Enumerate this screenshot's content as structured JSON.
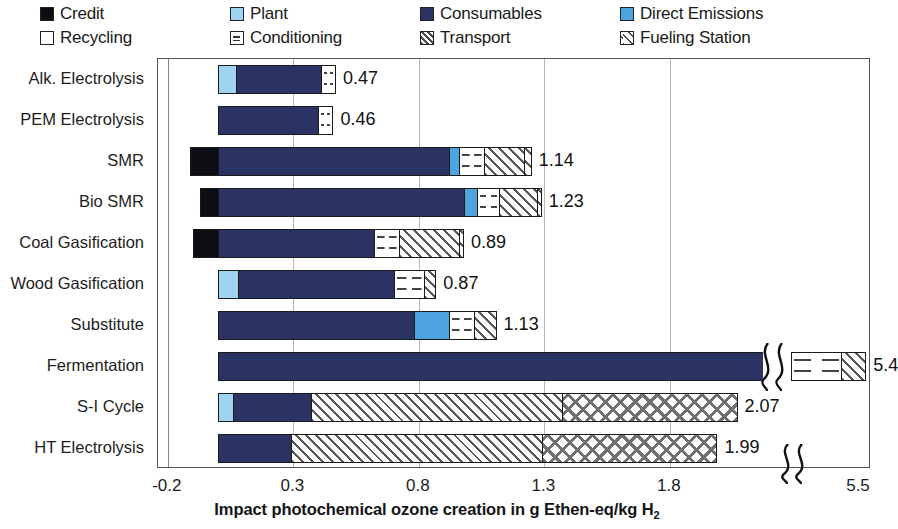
{
  "legend": {
    "items": [
      {
        "label": "Credit",
        "key": "credit",
        "color": "#0d0d14"
      },
      {
        "label": "Plant",
        "key": "plant",
        "color": "#9fd3f2"
      },
      {
        "label": "Consumables",
        "key": "consumables",
        "color": "#2b3264"
      },
      {
        "label": "Direct Emissions",
        "key": "direct",
        "color": "#4da2e0"
      },
      {
        "label": "Recycling",
        "key": "recycling",
        "color": "#ffffff"
      },
      {
        "label": "Conditioning",
        "key": "conditioning",
        "color": "#ffffff"
      },
      {
        "label": "Transport",
        "key": "transport",
        "color": "#ffffff"
      },
      {
        "label": "Fueling Station",
        "key": "fueling",
        "color": "#ffffff"
      }
    ]
  },
  "axis": {
    "x_ticks": [
      "-0.2",
      "0.3",
      "0.8",
      "1.3",
      "1.8",
      "5.5"
    ],
    "x_title_main": "Impact photochemical ozone creation in g Ethen-eq/kg H",
    "x_title_sub": "2"
  },
  "chart_data": {
    "type": "bar",
    "orientation": "horizontal",
    "stacked": true,
    "title": "",
    "xlabel": "Impact photochemical ozone creation in g Ethen-eq/kg H2",
    "ylabel": "",
    "xlim": [
      -0.2,
      5.5
    ],
    "xticks": [
      -0.2,
      0.3,
      0.8,
      1.3,
      1.8,
      5.5
    ],
    "axis_break": true,
    "axis_break_after": 2.15,
    "grid": true,
    "legend_position": "top",
    "series_names": [
      "Credit",
      "Plant",
      "Consumables",
      "Direct Emissions",
      "Recycling",
      "Conditioning",
      "Transport",
      "Fueling Station"
    ],
    "categories": [
      "Alk. Electrolysis",
      "PEM Electrolysis",
      "SMR",
      "Bio SMR",
      "Coal Gasification",
      "Wood Gasification",
      "Substitute",
      "Fermentation",
      "S-I Cycle",
      "HT Electrolysis"
    ],
    "totals": [
      0.47,
      0.46,
      1.14,
      1.23,
      0.89,
      0.87,
      1.13,
      5.4,
      2.07,
      1.99
    ],
    "total_labels": [
      "0.47",
      "0.46",
      "1.14",
      "1.23",
      "0.89",
      "0.87",
      "1.13",
      "5.4",
      "2.07",
      "1.99"
    ],
    "rows": [
      {
        "category": "Alk. Electrolysis",
        "total_label": "0.47",
        "segments": [
          {
            "key": "plant",
            "name": "Plant",
            "value": 0.07
          },
          {
            "key": "consumables",
            "name": "Consumables",
            "value": 0.34
          },
          {
            "key": "conditioning",
            "name": "Conditioning",
            "value": 0.06
          }
        ]
      },
      {
        "category": "PEM Electrolysis",
        "total_label": "0.46",
        "segments": [
          {
            "key": "consumables",
            "name": "Consumables",
            "value": 0.4
          },
          {
            "key": "conditioning",
            "name": "Conditioning",
            "value": 0.06
          }
        ]
      },
      {
        "category": "SMR",
        "total_label": "1.14",
        "segments": [
          {
            "key": "credit",
            "name": "Credit",
            "value": -0.11
          },
          {
            "key": "consumables",
            "name": "Consumables",
            "value": 0.92
          },
          {
            "key": "direct",
            "name": "Direct Emissions",
            "value": 0.04
          },
          {
            "key": "conditioning",
            "name": "Conditioning",
            "value": 0.1
          },
          {
            "key": "transport",
            "name": "Transport",
            "value": 0.16
          },
          {
            "key": "fueling",
            "name": "Fueling Station",
            "value": 0.03
          }
        ]
      },
      {
        "category": "Bio SMR",
        "total_label": "1.23",
        "segments": [
          {
            "key": "credit",
            "name": "Credit",
            "value": -0.07
          },
          {
            "key": "consumables",
            "name": "Consumables",
            "value": 0.98
          },
          {
            "key": "direct",
            "name": "Direct Emissions",
            "value": 0.05
          },
          {
            "key": "conditioning",
            "name": "Conditioning",
            "value": 0.09
          },
          {
            "key": "transport",
            "name": "Transport",
            "value": 0.15
          },
          {
            "key": "fueling",
            "name": "Fueling Station",
            "value": 0.02
          }
        ]
      },
      {
        "category": "Coal Gasification",
        "total_label": "0.89",
        "segments": [
          {
            "key": "credit",
            "name": "Credit",
            "value": -0.1
          },
          {
            "key": "consumables",
            "name": "Consumables",
            "value": 0.62
          },
          {
            "key": "conditioning",
            "name": "Conditioning",
            "value": 0.1
          },
          {
            "key": "transport",
            "name": "Transport",
            "value": 0.24
          },
          {
            "key": "fueling",
            "name": "Fueling Station",
            "value": 0.02
          }
        ]
      },
      {
        "category": "Wood Gasification",
        "total_label": "0.87",
        "segments": [
          {
            "key": "plant",
            "name": "Plant",
            "value": 0.08
          },
          {
            "key": "consumables",
            "name": "Consumables",
            "value": 0.62
          },
          {
            "key": "conditioning",
            "name": "Conditioning",
            "value": 0.12
          },
          {
            "key": "transport",
            "name": "Transport",
            "value": 0.05
          }
        ]
      },
      {
        "category": "Substitute",
        "total_label": "1.13",
        "segments": [
          {
            "key": "consumables",
            "name": "Consumables",
            "value": 0.78
          },
          {
            "key": "direct",
            "name": "Direct Emissions",
            "value": 0.14
          },
          {
            "key": "conditioning",
            "name": "Conditioning",
            "value": 0.1
          },
          {
            "key": "transport",
            "name": "Transport",
            "value": 0.09
          }
        ]
      },
      {
        "category": "Fermentation",
        "total_label": "5.4",
        "broken": true,
        "segments": [
          {
            "key": "consumables",
            "name": "Consumables",
            "value": 5.1
          },
          {
            "key": "conditioning",
            "name": "Conditioning",
            "value": 0.2
          },
          {
            "key": "transport",
            "name": "Transport",
            "value": 0.1
          }
        ]
      },
      {
        "category": "S-I Cycle",
        "total_label": "2.07",
        "segments": [
          {
            "key": "plant",
            "name": "Plant",
            "value": 0.06
          },
          {
            "key": "consumables",
            "name": "Consumables",
            "value": 0.31
          },
          {
            "key": "transport",
            "name": "Transport",
            "value": 1.0
          },
          {
            "key": "fueling",
            "name": "Fueling Station",
            "value": 0.7
          }
        ]
      },
      {
        "category": "HT Electrolysis",
        "total_label": "1.99",
        "segments": [
          {
            "key": "consumables",
            "name": "Consumables",
            "value": 0.29
          },
          {
            "key": "transport",
            "name": "Transport",
            "value": 1.0
          },
          {
            "key": "fueling",
            "name": "Fueling Station",
            "value": 0.7
          }
        ]
      }
    ]
  }
}
